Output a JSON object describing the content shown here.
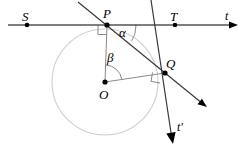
{
  "figure": {
    "type": "geometry-diagram",
    "width": 247,
    "height": 157,
    "background_color": "#ffffff",
    "stroke_color": "#000000",
    "circle_color": "#cfcfcf",
    "construction_color": "#7a7a7a",
    "labels": {
      "s_point": "S",
      "p_point": "P",
      "t_point": "T",
      "q_point": "Q",
      "o_point": "O",
      "t_line": "t",
      "t_prime_line": "t'",
      "alpha_angle": "α",
      "beta_angle": "β"
    },
    "points": {
      "S": {
        "x": 27,
        "y": 25
      },
      "P": {
        "x": 107,
        "y": 25
      },
      "T": {
        "x": 175,
        "y": 25
      },
      "Q": {
        "x": 165,
        "y": 73
      },
      "O": {
        "x": 105,
        "y": 82
      }
    },
    "circle": {
      "cx": 105,
      "cy": 82,
      "r": 53
    },
    "lines": {
      "t_horizontal": {
        "x1": 8,
        "y1": 25,
        "x2": 238,
        "y2": 25,
        "arrow": "right"
      },
      "secant_PQ": {
        "x1": 78,
        "y1": 2,
        "x2": 207,
        "y2": 107,
        "arrow": "end"
      },
      "t_prime": {
        "x1": 151,
        "y1": 0,
        "x2": 173,
        "y2": 144,
        "arrow": "end"
      },
      "radius_OP": {
        "x1": 105,
        "y1": 82,
        "x2": 107,
        "y2": 25
      },
      "radius_OQ": {
        "x1": 105,
        "y1": 82,
        "x2": 165,
        "y2": 73
      }
    },
    "right_angle_markers": [
      {
        "at": "P",
        "x": 97,
        "y": 26
      },
      {
        "at": "Q",
        "x": 152,
        "y": 74
      }
    ],
    "angle_arcs": [
      {
        "name": "alpha",
        "vertex": "P",
        "label_x": 121,
        "label_y": 29
      },
      {
        "name": "beta",
        "vertex": "O",
        "label_x": 109,
        "label_y": 55
      }
    ],
    "label_positions": {
      "S": {
        "x": 22,
        "y": 10
      },
      "P": {
        "x": 103,
        "y": 8
      },
      "T": {
        "x": 170,
        "y": 10
      },
      "Q": {
        "x": 167,
        "y": 58
      },
      "O": {
        "x": 99,
        "y": 88
      },
      "t": {
        "x": 225,
        "y": 11
      },
      "t_prime": {
        "x": 178,
        "y": 122
      },
      "alpha": {
        "x": 119,
        "y": 27
      },
      "beta": {
        "x": 107,
        "y": 52
      }
    }
  }
}
